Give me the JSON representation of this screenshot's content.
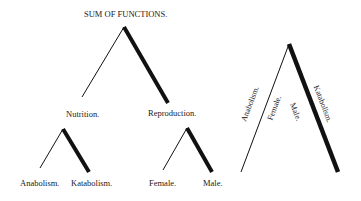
{
  "diagram": {
    "title": "SUM OF FUNCTIONS.",
    "tree": {
      "root": "SUM OF FUNCTIONS.",
      "children": [
        {
          "label": "Nutrition.",
          "children": [
            {
              "label": "Anabolism."
            },
            {
              "label": "Katabolism."
            }
          ]
        },
        {
          "label": "Reproduction.",
          "children": [
            {
              "label": "Female."
            },
            {
              "label": "Male."
            }
          ]
        }
      ]
    },
    "combined": {
      "left_outer": "Anabolism.",
      "left_inner": "Female.",
      "right_inner": "Male.",
      "right_outer": "Katabolism."
    },
    "colors": {
      "line": "#111111",
      "background": "#ffffff"
    }
  }
}
